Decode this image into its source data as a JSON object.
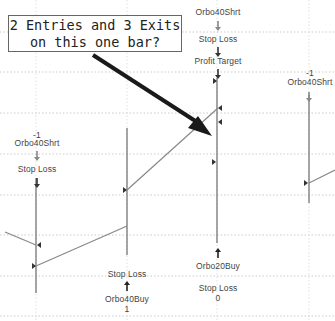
{
  "callout": {
    "line1": "2 Entries and 3 Exits",
    "line2": "on this one bar?"
  },
  "bars": [
    {
      "name": "bar-1",
      "top_labels": [
        "-1",
        "Orbo40Shrt",
        "Stop Loss"
      ],
      "bottom_labels": []
    },
    {
      "name": "bar-2",
      "top_labels": [],
      "bottom_labels": [
        "Stop Loss",
        "Orbo40Buy",
        "1"
      ]
    },
    {
      "name": "bar-3",
      "top_labels": [
        "Orbo40Shrt",
        "Stop Loss",
        "Profit Target"
      ],
      "bottom_labels": [
        "Orbo20Buy",
        "Stop Loss",
        "0"
      ]
    },
    {
      "name": "bar-4",
      "top_labels": [
        "-1",
        "Orbo40Shrt"
      ],
      "bottom_labels": []
    }
  ],
  "colors": {
    "grid": "#aaaaaa",
    "bar": "#777777",
    "trade_line": "#888888",
    "arrow": "#222222",
    "callout_border": "#666666"
  }
}
